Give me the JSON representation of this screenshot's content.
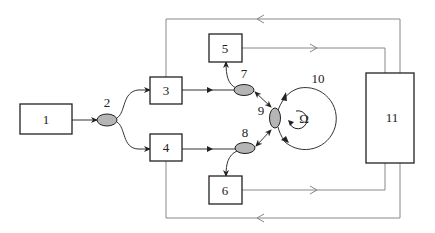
{
  "diagram": {
    "type": "fiber optic gyroscope block diagram",
    "blocks": [
      {
        "id": "1",
        "label": "1"
      },
      {
        "id": "3",
        "label": "3"
      },
      {
        "id": "4",
        "label": "4"
      },
      {
        "id": "5",
        "label": "5"
      },
      {
        "id": "6",
        "label": "6"
      },
      {
        "id": "11",
        "label": "11"
      }
    ],
    "couplers": [
      {
        "id": "2",
        "label": "2"
      },
      {
        "id": "7",
        "label": "7"
      },
      {
        "id": "8",
        "label": "8"
      },
      {
        "id": "9",
        "label": "9"
      }
    ],
    "coil": {
      "id": "10",
      "label": "10",
      "rotation_symbol": "Ω"
    },
    "colors": {
      "stroke": "#222222",
      "coupler_fill": "#b5b5b5",
      "feedback_line": "#888888",
      "background": "#ffffff"
    }
  }
}
